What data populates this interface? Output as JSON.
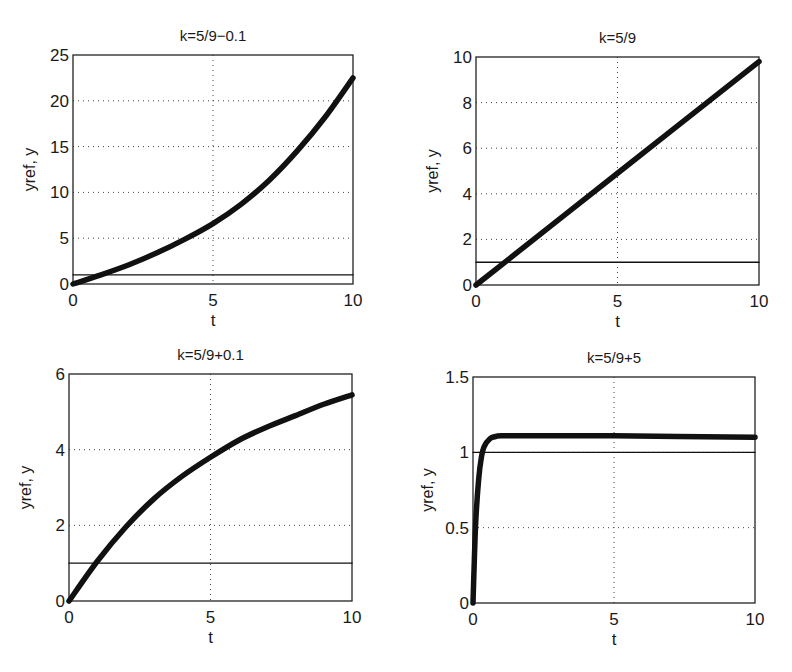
{
  "chart_data": [
    {
      "type": "line",
      "title": "k=5/9−0.1",
      "xlabel": "t",
      "ylabel": "yref, y",
      "xlim": [
        0,
        10
      ],
      "ylim": [
        0,
        25
      ],
      "xticks": [
        "0",
        "5",
        "10"
      ],
      "yticks": [
        "0",
        "5",
        "10",
        "15",
        "20",
        "25"
      ],
      "grid": true,
      "series": [
        {
          "name": "y",
          "style": "thick",
          "x": [
            0,
            1,
            2,
            3,
            4,
            5,
            6,
            7,
            8,
            9,
            10
          ],
          "values": [
            0,
            1.0,
            2.1,
            3.4,
            4.9,
            6.6,
            8.7,
            11.3,
            14.5,
            18.2,
            22.5
          ]
        },
        {
          "name": "yref",
          "style": "thin",
          "x": [
            0,
            10
          ],
          "values": [
            1,
            1
          ]
        }
      ]
    },
    {
      "type": "line",
      "title": "k=5/9",
      "xlabel": "t",
      "ylabel": "yref, y",
      "xlim": [
        0,
        10
      ],
      "ylim": [
        0,
        10
      ],
      "xticks": [
        "0",
        "5",
        "10"
      ],
      "yticks": [
        "0",
        "2",
        "4",
        "6",
        "8",
        "10"
      ],
      "grid": true,
      "series": [
        {
          "name": "y",
          "style": "thick",
          "x": [
            0,
            5,
            10
          ],
          "values": [
            0,
            4.9,
            9.8
          ]
        },
        {
          "name": "yref",
          "style": "thin",
          "x": [
            0,
            10
          ],
          "values": [
            1,
            1
          ]
        }
      ]
    },
    {
      "type": "line",
      "title": "k=5/9+0.1",
      "xlabel": "t",
      "ylabel": "yref, y",
      "xlim": [
        0,
        10
      ],
      "ylim": [
        0,
        6
      ],
      "xticks": [
        "0",
        "5",
        "10"
      ],
      "yticks": [
        "0",
        "2",
        "4",
        "6"
      ],
      "grid": true,
      "series": [
        {
          "name": "y",
          "style": "thick",
          "x": [
            0,
            1,
            2,
            3,
            4,
            5,
            6,
            7,
            8,
            9,
            10
          ],
          "values": [
            0,
            1.05,
            1.95,
            2.7,
            3.3,
            3.8,
            4.25,
            4.6,
            4.9,
            5.2,
            5.45
          ]
        },
        {
          "name": "yref",
          "style": "thin",
          "x": [
            0,
            10
          ],
          "values": [
            1,
            1
          ]
        }
      ]
    },
    {
      "type": "line",
      "title": "k=5/9+5",
      "xlabel": "t",
      "ylabel": "yref, y",
      "xlim": [
        0,
        10
      ],
      "ylim": [
        0,
        1.5
      ],
      "xticks": [
        "0",
        "5",
        "10"
      ],
      "yticks": [
        "0",
        "0.5",
        "1",
        "1.5"
      ],
      "grid": true,
      "series": [
        {
          "name": "y",
          "style": "thick",
          "x": [
            0,
            0.05,
            0.1,
            0.2,
            0.3,
            0.4,
            0.6,
            0.8,
            1,
            2,
            5,
            10
          ],
          "values": [
            0,
            0.3,
            0.55,
            0.82,
            0.97,
            1.04,
            1.09,
            1.105,
            1.11,
            1.11,
            1.11,
            1.1
          ]
        },
        {
          "name": "yref",
          "style": "thin",
          "x": [
            0,
            10
          ],
          "values": [
            1,
            1
          ]
        }
      ]
    }
  ]
}
